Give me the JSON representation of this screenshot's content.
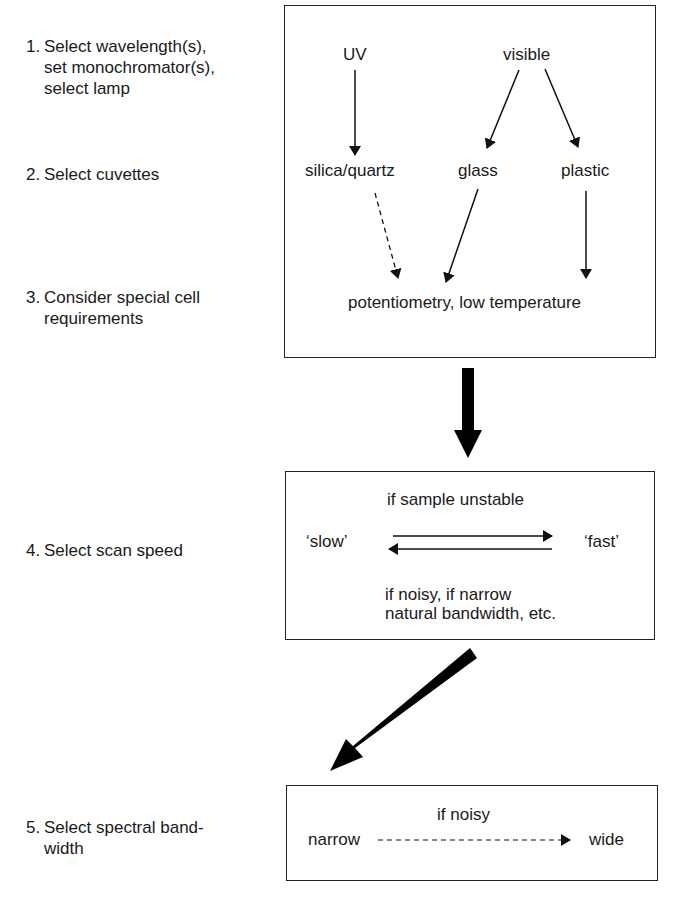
{
  "steps": [
    {
      "num": "1.",
      "lines": [
        "Select wavelength(s),",
        "set monochromator(s),",
        "select lamp"
      ]
    },
    {
      "num": "2.",
      "lines": [
        "Select cuvettes"
      ]
    },
    {
      "num": "3.",
      "lines": [
        "Consider special cell",
        "requirements"
      ]
    },
    {
      "num": "4.",
      "lines": [
        "Select scan speed"
      ]
    },
    {
      "num": "5.",
      "lines": [
        "Select spectral band-",
        "width"
      ]
    }
  ],
  "box1": {
    "uv": "UV",
    "visible": "visible",
    "silica": "silica/quartz",
    "glass": "glass",
    "plastic": "plastic",
    "special": "potentiometry, low temperature"
  },
  "box2": {
    "top": "if sample unstable",
    "slow": "‘slow’",
    "fast": "‘fast’",
    "bottom1": "if noisy, if narrow",
    "bottom2": "natural bandwidth, etc."
  },
  "box3": {
    "top": "if noisy",
    "narrow": "narrow",
    "wide": "wide"
  }
}
